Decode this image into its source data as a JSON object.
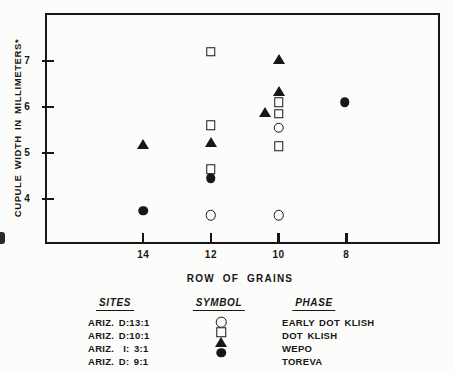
{
  "chart_data": {
    "type": "scatter",
    "title": "",
    "xlabel": "ROW OF GRAINS",
    "ylabel": "CUPULE WIDTH IN MILLIMETERS*",
    "x_ticks": [
      14,
      12,
      10,
      8
    ],
    "y_ticks": [
      7,
      6,
      5,
      4
    ],
    "x_axis_reversed": true,
    "xlim": [
      16.9,
      5.25
    ],
    "ylim": [
      2.98,
      8.05
    ],
    "grid": false,
    "legend_position": "below",
    "series": [
      {
        "name": "EARLY DOT KLISH",
        "site": "ARIZ. D:13:1",
        "symbol": "open-circle",
        "points": [
          [
            10,
            5.55
          ],
          [
            12,
            3.65
          ],
          [
            10,
            3.65
          ]
        ]
      },
      {
        "name": "DOT KLISH",
        "site": "ARIZ. D:10:1",
        "symbol": "open-square",
        "points": [
          [
            12,
            7.2
          ],
          [
            12,
            5.6
          ],
          [
            12,
            4.65
          ],
          [
            10,
            6.1
          ],
          [
            10,
            5.85
          ],
          [
            10,
            5.15
          ]
        ]
      },
      {
        "name": "WEPO",
        "site": "ARIZ. I: 3:1",
        "symbol": "filled-triangle",
        "points": [
          [
            14,
            5.2
          ],
          [
            12,
            5.25
          ],
          [
            10,
            7.05
          ],
          [
            10,
            6.35
          ],
          [
            10.4,
            5.9
          ]
        ]
      },
      {
        "name": "TOREVA",
        "site": "ARIZ. D: 9:1",
        "symbol": "filled-circle",
        "points": [
          [
            14,
            3.75
          ],
          [
            12,
            4.45
          ],
          [
            8.05,
            6.1
          ]
        ]
      }
    ]
  },
  "legend": {
    "headers": {
      "sites": "SITES",
      "symbol": "SYMBOL",
      "phase": "PHASE"
    },
    "rows": [
      {
        "site": "ARIZ. D:13:1",
        "symbol": "open-circle",
        "phase": "EARLY DOT KLISH"
      },
      {
        "site": "ARIZ. D:10:1",
        "symbol": "open-square",
        "phase": "DOT KLISH"
      },
      {
        "site": "ARIZ.  I: 3:1",
        "symbol": "filled-triangle",
        "phase": "WEPO"
      },
      {
        "site": "ARIZ. D: 9:1",
        "symbol": "filled-circle",
        "phase": "TOREVA"
      }
    ]
  },
  "colors": {
    "ink": "#171717",
    "paper": "#fcfcfa"
  }
}
